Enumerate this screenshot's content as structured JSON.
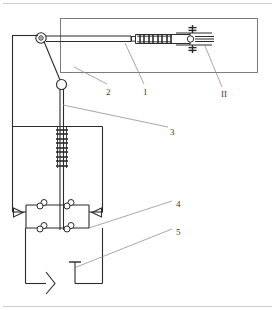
{
  "diagram": {
    "line_color": "#2b2b2b",
    "thin_line_color": "#8a8a8a",
    "frame_color": "#cfcfcf",
    "background": "#ffffff",
    "callouts": [
      {
        "id": "callout-1",
        "text": "1",
        "x": 143,
        "y": 92,
        "leader": "from boom cylinder rod up-right"
      },
      {
        "id": "callout-2",
        "text": "2",
        "x": 107,
        "y": 92,
        "leader": "from outer boom enclosure"
      },
      {
        "id": "callout-3",
        "text": "3",
        "x": 170,
        "y": 132,
        "leader": "from vertical spring / mast rod"
      },
      {
        "id": "callout-4",
        "text": "4",
        "x": 176,
        "y": 205,
        "leader": "from check-valve bridge"
      },
      {
        "id": "callout-5",
        "text": "5",
        "x": 176,
        "y": 233,
        "leader": "from reservoir / tank line"
      },
      {
        "id": "callout-II",
        "text": "II",
        "x": 222,
        "y": 95,
        "leader": "from right-hand bolted head"
      }
    ],
    "components": [
      {
        "name": "outer-page-frame",
        "type": "frame"
      },
      {
        "name": "boom-enclosure",
        "type": "rectangle"
      },
      {
        "name": "pulley-assembly",
        "type": "pulley"
      },
      {
        "name": "boom-horizontal-arm",
        "type": "double-line"
      },
      {
        "name": "boom-spring-pack",
        "type": "coil-pack",
        "coils": 4
      },
      {
        "name": "boom-head-bolted",
        "type": "bolted-head"
      },
      {
        "name": "hinge-joint-circle",
        "type": "circle"
      },
      {
        "name": "mast-vertical-rod",
        "type": "rod"
      },
      {
        "name": "mast-spring-pack",
        "type": "coil-pack",
        "coils": 5
      },
      {
        "name": "upper-chamber-box",
        "type": "rectangle"
      },
      {
        "name": "check-valve-bridge",
        "type": "valve-bridge",
        "valves": 4
      },
      {
        "name": "left-arrow-valve",
        "type": "triangle-valve"
      },
      {
        "name": "right-arrow-valve",
        "type": "triangle-valve"
      },
      {
        "name": "lower-chamber-box",
        "type": "rectangle"
      },
      {
        "name": "pump-arrow-symbol",
        "type": "chevron"
      },
      {
        "name": "tank-symbol",
        "type": "tank-tee"
      }
    ]
  }
}
